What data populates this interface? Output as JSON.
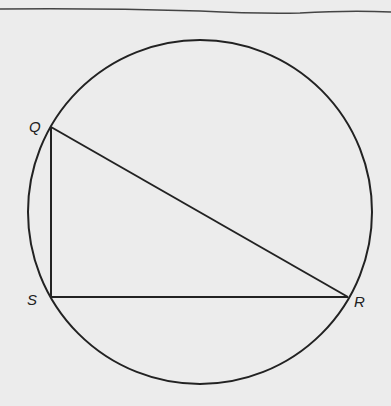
{
  "diagram": {
    "type": "geometry",
    "circle": {
      "cx": 200,
      "cy": 212,
      "r": 172
    },
    "points": [
      {
        "id": "Q",
        "label": "Q",
        "x": 51,
        "y": 127,
        "label_x": 29,
        "label_y": 132
      },
      {
        "id": "S",
        "label": "S",
        "x": 51,
        "y": 297,
        "label_x": 27,
        "label_y": 305
      },
      {
        "id": "R",
        "label": "R",
        "x": 348,
        "y": 297,
        "label_x": 354,
        "label_y": 307
      }
    ],
    "segments": [
      [
        "Q",
        "S"
      ],
      [
        "S",
        "R"
      ],
      [
        "Q",
        "R"
      ]
    ],
    "stroke_color": "#222222",
    "background_color": "#ececec"
  }
}
